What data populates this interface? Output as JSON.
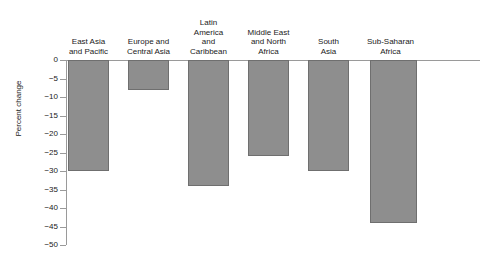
{
  "chart_data": {
    "type": "bar",
    "title": "",
    "subtitle": "",
    "xlabel": "",
    "ylabel": "Percent change",
    "ylim": [
      -50,
      0
    ],
    "ytick_step": 5,
    "grid": false,
    "legend": "none",
    "orientation": "vertical",
    "bar_color": "#8e8e8e",
    "bar_edge_color": "#6f6f6f",
    "axis_color": "#9a9a9a",
    "categories": [
      "East Asia\nand Pacific",
      "Europe and\nCentral Asia",
      "Latin\nAmerica\nand\nCaribbean",
      "Middle East\nand North\nAfrica",
      "South\nAsia",
      "Sub-Saharan\nAfrica"
    ],
    "values": [
      -30,
      -8,
      -34,
      -26,
      -30,
      -44
    ],
    "ytick_labels": [
      "0",
      "-5",
      "-10",
      "-15",
      "-20",
      "-25",
      "-30",
      "-35",
      "-40",
      "-45",
      "-50"
    ],
    "ytick_values": [
      0,
      -5,
      -10,
      -15,
      -20,
      -25,
      -30,
      -35,
      -40,
      -45,
      -50
    ]
  }
}
